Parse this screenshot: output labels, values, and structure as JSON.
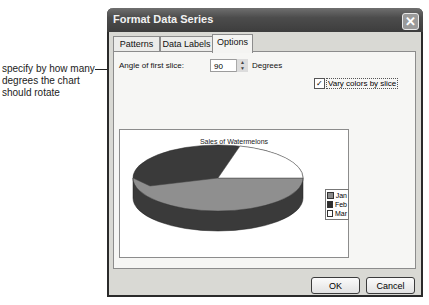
{
  "annotation": {
    "text": "specify by how many degrees the chart should rotate"
  },
  "dialog": {
    "title": "Format Data Series",
    "close_icon": "close-icon",
    "tabs": [
      {
        "label": "Patterns",
        "active": false
      },
      {
        "label": "Data Labels",
        "active": false
      },
      {
        "label": "Options",
        "active": true
      }
    ],
    "options": {
      "angle_label": "Angle of first slice:",
      "angle_value": "90",
      "angle_unit": "Degrees",
      "vary_colors_label": "Vary colors by slice",
      "vary_colors_checked": true
    },
    "preview": {
      "title": "Sales of Watermelons",
      "legend": [
        {
          "label": "Jan",
          "color": "#8a8a8a"
        },
        {
          "label": "Feb",
          "color": "#2e2e2e"
        },
        {
          "label": "Mar",
          "color": "#ffffff"
        }
      ]
    },
    "buttons": {
      "ok": "OK",
      "cancel": "Cancel"
    }
  }
}
